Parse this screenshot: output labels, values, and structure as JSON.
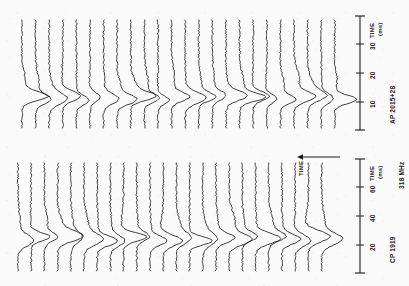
{
  "figure": {
    "orientation": "rotated-90",
    "background_color": "#fbfbfc",
    "ink_color": "#1a1a1a",
    "global_time_arrow": {
      "label": "TIME",
      "direction": "up"
    }
  },
  "panels": [
    {
      "id": "panel-top",
      "source_label": "AP 2015+28",
      "axis_title_line1": "TIME",
      "axis_title_line2": "(ms)",
      "ticks": [
        {
          "value": 10,
          "label": "10"
        },
        {
          "value": 20,
          "label": "20"
        },
        {
          "value": 30,
          "label": "30"
        }
      ],
      "trace_count": 24
    },
    {
      "id": "panel-bottom",
      "source_label": "CP 1919",
      "frequency_label": "318 MHz",
      "axis_title_line1": "TIME",
      "axis_title_line2": "(ms)",
      "ticks": [
        {
          "value": 20,
          "label": "20"
        },
        {
          "value": 40,
          "label": "40"
        },
        {
          "value": 60,
          "label": "60"
        }
      ],
      "trace_count": 24
    }
  ],
  "chart_data": {
    "type": "line",
    "title": "",
    "subtitle": "",
    "xlabel": "TIME (ms)",
    "ylabel": "TIME",
    "grid": false,
    "legend_position": "none",
    "note": "Stacked single-pulse intensity traces; each trace is one successive pulse period. Figure is printed rotated 90 degrees so the pulse-phase TIME (ms) axis runs vertically at right and successive pulses stack horizontally.",
    "charts": [
      {
        "id": "panel-top",
        "source": "AP 2015+28",
        "xlabel": "TIME (ms)",
        "xlim": [
          0,
          38
        ],
        "xticks": [
          10,
          20,
          30
        ],
        "series_count": 24,
        "series_label": "successive pulses",
        "peak_time_ms": 18,
        "peaks_per_trace": [
          {
            "trace": 1,
            "amplitude": 0.95,
            "time_ms": 17.5
          },
          {
            "trace": 2,
            "amplitude": 0.55,
            "time_ms": 18.0
          },
          {
            "trace": 3,
            "amplitude": 0.62,
            "time_ms": 18.2
          },
          {
            "trace": 4,
            "amplitude": 0.7,
            "time_ms": 18.4
          },
          {
            "trace": 5,
            "amplitude": 0.48,
            "time_ms": 18.1
          },
          {
            "trace": 6,
            "amplitude": 0.4,
            "time_ms": 17.9
          },
          {
            "trace": 7,
            "amplitude": 0.58,
            "time_ms": 18.3
          },
          {
            "trace": 8,
            "amplitude": 0.72,
            "time_ms": 18.5
          },
          {
            "trace": 9,
            "amplitude": 0.88,
            "time_ms": 18.6
          },
          {
            "trace": 10,
            "amplitude": 0.52,
            "time_ms": 18.0
          },
          {
            "trace": 11,
            "amplitude": 0.45,
            "time_ms": 17.8
          },
          {
            "trace": 12,
            "amplitude": 0.66,
            "time_ms": 18.2
          },
          {
            "trace": 13,
            "amplitude": 0.8,
            "time_ms": 18.4
          },
          {
            "trace": 14,
            "amplitude": 0.6,
            "time_ms": 18.1
          },
          {
            "trace": 15,
            "amplitude": 0.5,
            "time_ms": 17.9
          },
          {
            "trace": 16,
            "amplitude": 0.75,
            "time_ms": 18.3
          },
          {
            "trace": 17,
            "amplitude": 0.9,
            "time_ms": 18.5
          },
          {
            "trace": 18,
            "amplitude": 0.64,
            "time_ms": 18.2
          },
          {
            "trace": 19,
            "amplitude": 0.42,
            "time_ms": 17.7
          },
          {
            "trace": 20,
            "amplitude": 0.56,
            "time_ms": 18.0
          },
          {
            "trace": 21,
            "amplitude": 0.78,
            "time_ms": 18.4
          },
          {
            "trace": 22,
            "amplitude": 0.68,
            "time_ms": 18.2
          },
          {
            "trace": 23,
            "amplitude": 0.46,
            "time_ms": 17.8
          },
          {
            "trace": 24,
            "amplitude": 0.84,
            "time_ms": 18.5
          }
        ]
      },
      {
        "id": "panel-bottom",
        "source": "CP 1919",
        "frequency": "318 MHz",
        "xlabel": "TIME (ms)",
        "xlim": [
          0,
          75
        ],
        "xticks": [
          20,
          40,
          60
        ],
        "series_count": 24,
        "series_label": "successive pulses",
        "peak_time_ms": 38,
        "peaks_per_trace": [
          {
            "trace": 1,
            "amplitude": 0.58,
            "time_ms": 37.0
          },
          {
            "trace": 2,
            "amplitude": 0.72,
            "time_ms": 38.0
          },
          {
            "trace": 3,
            "amplitude": 0.5,
            "time_ms": 37.5
          },
          {
            "trace": 4,
            "amplitude": 0.85,
            "time_ms": 38.4
          },
          {
            "trace": 5,
            "amplitude": 0.44,
            "time_ms": 37.2
          },
          {
            "trace": 6,
            "amplitude": 0.66,
            "time_ms": 38.1
          },
          {
            "trace": 7,
            "amplitude": 0.78,
            "time_ms": 38.3
          },
          {
            "trace": 8,
            "amplitude": 0.54,
            "time_ms": 37.6
          },
          {
            "trace": 9,
            "amplitude": 0.92,
            "time_ms": 38.6
          },
          {
            "trace": 10,
            "amplitude": 0.48,
            "time_ms": 37.4
          },
          {
            "trace": 11,
            "amplitude": 0.62,
            "time_ms": 38.0
          },
          {
            "trace": 12,
            "amplitude": 0.74,
            "time_ms": 38.2
          },
          {
            "trace": 13,
            "amplitude": 0.56,
            "time_ms": 37.7
          },
          {
            "trace": 14,
            "amplitude": 0.88,
            "time_ms": 38.5
          },
          {
            "trace": 15,
            "amplitude": 0.46,
            "time_ms": 37.3
          },
          {
            "trace": 16,
            "amplitude": 0.68,
            "time_ms": 38.1
          },
          {
            "trace": 17,
            "amplitude": 0.8,
            "time_ms": 38.4
          },
          {
            "trace": 18,
            "amplitude": 0.52,
            "time_ms": 37.5
          },
          {
            "trace": 19,
            "amplitude": 0.95,
            "time_ms": 38.7
          },
          {
            "trace": 20,
            "amplitude": 0.6,
            "time_ms": 38.0
          },
          {
            "trace": 21,
            "amplitude": 0.7,
            "time_ms": 38.2
          },
          {
            "trace": 22,
            "amplitude": 0.64,
            "time_ms": 38.0
          },
          {
            "trace": 23,
            "amplitude": 0.9,
            "time_ms": 38.5
          },
          {
            "trace": 24,
            "amplitude": 0.75,
            "time_ms": 38.3
          }
        ]
      }
    ]
  }
}
